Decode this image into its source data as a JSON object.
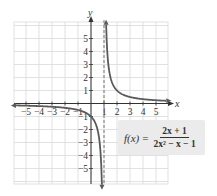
{
  "chart_data": {
    "type": "line",
    "title": "",
    "xlabel": "x",
    "ylabel": "y",
    "xlim": [
      -5.9,
      6.0
    ],
    "ylim": [
      -6.2,
      6.3
    ],
    "grid": true,
    "x_ticks": [
      -5,
      -4,
      -3,
      -2,
      -1,
      1,
      2,
      3,
      4,
      5
    ],
    "y_ticks": [
      -5,
      -4,
      -3,
      -2,
      -1,
      1,
      2,
      3,
      4,
      5
    ],
    "x_tick_labels": [
      "−5",
      "−4",
      "−3",
      "−2",
      "−1",
      "1",
      "2",
      "3",
      "4",
      "5"
    ],
    "y_tick_labels": [
      "−5",
      "−4",
      "−3",
      "−2",
      "−1",
      "1",
      "2",
      "3",
      "4",
      "5"
    ],
    "vertical_asymptote": 1,
    "horizontal_asymptote": 0,
    "series": [
      {
        "name": "f(x) = (2x+1)/(2x^2 - x - 1)",
        "function": "(2x+1)/(2x^2-x-1) = 1/(x-1), hole at x=-1/2",
        "branches": [
          {
            "x": [
              -5.8,
              -5,
              -4,
              -3,
              -2,
              -1,
              0,
              0.5,
              0.8,
              0.85
            ],
            "y": [
              -0.147,
              -0.167,
              -0.2,
              -0.25,
              -0.333,
              -0.5,
              -1,
              -2,
              -5,
              -6.2
            ]
          },
          {
            "x": [
              1.16,
              1.2,
              1.5,
              2,
              3,
              4,
              5,
              5.8
            ],
            "y": [
              6.2,
              5,
              2,
              1,
              0.5,
              0.333,
              0.25,
              0.208
            ]
          }
        ]
      }
    ],
    "annotations": [
      {
        "text": "f(x) = (2x + 1)/(2x² − x − 1)",
        "position": "lower-right box"
      }
    ]
  },
  "labels": {
    "x_axis": "x",
    "y_axis": "y",
    "formula_lhs": "f(x)",
    "formula_eq": "=",
    "formula_num": "2x + 1",
    "formula_den": "2x² − x − 1"
  },
  "colors": {
    "grid": "#d9d9d9",
    "axis": "#333333",
    "curve": "#5a5a5a",
    "asymptote": "#555555",
    "box": "#ebebeb"
  }
}
